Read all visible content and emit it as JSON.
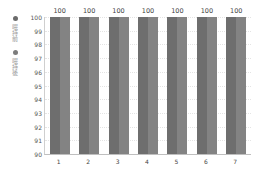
{
  "legend": [
    {
      "label": "喂持前",
      "color": "#6b6b6b"
    },
    {
      "label": "喂持後",
      "color": "#7c7c7c"
    }
  ],
  "colors": {
    "series1": "#6e6e6e",
    "series2": "#838383"
  },
  "chart_data": {
    "type": "bar",
    "title": "",
    "xlabel": "",
    "ylabel": "",
    "categories": [
      "1",
      "2",
      "3",
      "4",
      "5",
      "6",
      "7"
    ],
    "series": [
      {
        "name": "喂持前",
        "values": [
          100,
          100,
          100,
          100,
          100,
          100,
          100
        ]
      },
      {
        "name": "喂持後",
        "values": [
          100,
          100,
          100,
          100,
          100,
          100,
          100
        ]
      }
    ],
    "data_labels": [
      "100",
      "100",
      "100",
      "100",
      "100",
      "100",
      "100"
    ],
    "ylim": [
      90,
      100
    ],
    "yticks": [
      "100",
      "99",
      "98",
      "97",
      "96",
      "95",
      "94",
      "93",
      "92",
      "91",
      "90"
    ],
    "grid": true,
    "legend_position": "left-vertical"
  }
}
